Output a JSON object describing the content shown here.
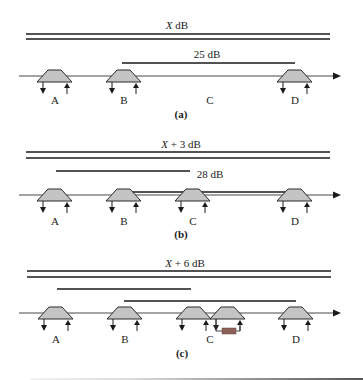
{
  "figure": {
    "colors": {
      "line": "#1a1a1a",
      "axis": "#333333",
      "trapezoid_fill": "#c4c4c4",
      "trapezoid_stroke": "#2a2a2a",
      "resistor_fill": "#8c5f58",
      "bottom_rule_light": "#e6e6e6",
      "bottom_rule_dark": "#555555"
    },
    "panels": [
      {
        "id": "a",
        "caption": "(a)",
        "caption_pos": [
          181,
          118
        ],
        "title": {
          "var": "X",
          "suffix": " dB",
          "x": 177,
          "y": 29
        },
        "double_lines": {
          "y1": 34,
          "y2": 39,
          "x1": 26,
          "x2": 330
        },
        "spans": [
          {
            "x1": 122,
            "x2": 295,
            "y": 63,
            "label": "25 dB",
            "label_x": 207,
            "label_y": 58
          }
        ],
        "axis_y": 76,
        "nodes": [
          {
            "label": "A",
            "x": 55,
            "label_y": 104,
            "amps": 1
          },
          {
            "label": "B",
            "x": 124,
            "label_y": 104,
            "amps": 1
          },
          {
            "label": "C",
            "x": 210,
            "label_y": 104,
            "amps": 0
          },
          {
            "label": "D",
            "x": 295,
            "label_y": 104,
            "amps": 1
          }
        ]
      },
      {
        "id": "b",
        "caption": "(b)",
        "caption_pos": [
          181,
          238
        ],
        "title": {
          "var": "X",
          "suffix": " + 3 dB",
          "x": 181,
          "y": 148
        },
        "double_lines": {
          "y1": 152,
          "y2": 158,
          "x1": 26,
          "x2": 330
        },
        "spans": [
          {
            "x1": 56,
            "x2": 190,
            "y": 171,
            "label": "",
            "label_x": 0,
            "label_y": 0
          },
          {
            "x1": 123,
            "x2": 295,
            "y": 192,
            "label": "28 dB",
            "label_x": 210,
            "label_y": 178
          }
        ],
        "axis_y": 195,
        "nodes": [
          {
            "label": "A",
            "x": 55,
            "label_y": 225,
            "amps": 1
          },
          {
            "label": "B",
            "x": 124,
            "label_y": 225,
            "amps": 1
          },
          {
            "label": "C",
            "x": 193,
            "label_y": 225,
            "amps": 1
          },
          {
            "label": "D",
            "x": 295,
            "label_y": 225,
            "amps": 1
          }
        ]
      },
      {
        "id": "c",
        "caption": "(c)",
        "caption_pos": [
          182,
          357
        ],
        "title": {
          "var": "X",
          "suffix": " + 6 dB",
          "x": 185,
          "y": 267
        },
        "double_lines": {
          "y1": 271,
          "y2": 277,
          "x1": 27,
          "x2": 331
        },
        "spans": [
          {
            "x1": 57,
            "x2": 191,
            "y": 289,
            "label": "",
            "label_x": 0,
            "label_y": 0
          },
          {
            "x1": 124,
            "x2": 296,
            "y": 301,
            "label": "",
            "label_x": 0,
            "label_y": 0
          }
        ],
        "axis_y": 313,
        "nodes": [
          {
            "label": "A",
            "x": 56,
            "label_y": 343,
            "amps": 1
          },
          {
            "label": "B",
            "x": 125,
            "label_y": 343,
            "amps": 1
          },
          {
            "label": "C",
            "x": 210,
            "label_y": 343,
            "amps": 2,
            "first_x": 194,
            "second_x": 228
          },
          {
            "label": "D",
            "x": 296,
            "label_y": 343,
            "amps": 1
          }
        ]
      }
    ],
    "axis": {
      "x1": 19,
      "x2": 341
    }
  }
}
